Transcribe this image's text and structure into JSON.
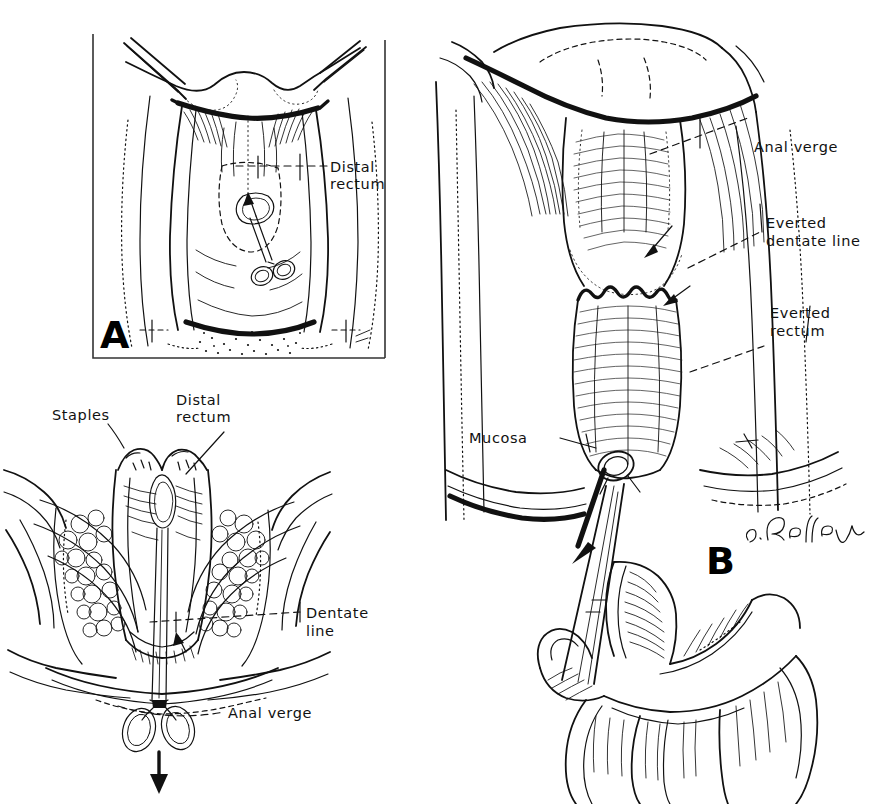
{
  "figure": {
    "kind": "medical-surgical-line-illustration",
    "background_color": "#ffffff",
    "ink_color": "#111111",
    "panels": [
      {
        "id": "A",
        "letter": "A",
        "caption_letter": "A",
        "has_frame": true,
        "description": "Transanal view of pelvis with forceps grasping distal rectum",
        "labels": [
          {
            "name": "distal-rectum",
            "line1": "Distal",
            "line2": "rectum"
          }
        ]
      },
      {
        "id": "C",
        "letter": "",
        "has_frame": false,
        "description": "Sagittal cross-section of rectum and anal canal with long forceps",
        "labels": [
          {
            "name": "staples",
            "line1": "Staples",
            "line2": ""
          },
          {
            "name": "distal-rectum",
            "line1": "Distal",
            "line2": "rectum"
          },
          {
            "name": "dentate-line",
            "line1": "Dentate",
            "line2": "line"
          },
          {
            "name": "anal-verge",
            "line1": "Anal verge",
            "line2": ""
          }
        ]
      },
      {
        "id": "B",
        "letter": "B",
        "caption_letter": "B",
        "has_frame": false,
        "description": "Everted rectum delivered through anus, grasped with forceps held in hand",
        "labels": [
          {
            "name": "anal-verge",
            "line1": "Anal verge",
            "line2": ""
          },
          {
            "name": "everted-dentate-line",
            "line1": "Everted",
            "line2": "dentate line"
          },
          {
            "name": "everted-rectum",
            "line1": "Everted",
            "line2": "rectum"
          },
          {
            "name": "mucosa",
            "line1": "Mucosa",
            "line2": ""
          }
        ]
      }
    ],
    "artist_signature": "J. Desley",
    "labels_flat": {
      "distal_rectum_l1": "Distal",
      "distal_rectum_l2": "rectum",
      "staples": "Staples",
      "dentate_line_l1": "Dentate",
      "dentate_line_l2": "line",
      "anal_verge": "Anal verge",
      "everted_l1": "Everted",
      "everted_dentate_l2": "dentate line",
      "everted_rectum_l2": "rectum",
      "mucosa": "Mucosa",
      "panel_a_letter": "A",
      "panel_b_letter": "B",
      "signature": "J. Desley"
    }
  }
}
